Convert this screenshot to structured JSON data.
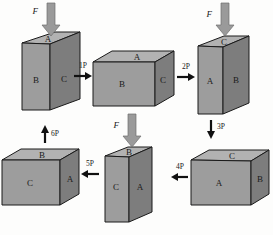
{
  "figure": {
    "caption": "",
    "colors": {
      "front_face": "#9d9d9d",
      "top_face": "#b2b2b2",
      "side_face": "#7d7d7d",
      "outline": "#1a1a1a",
      "force_arrow": "#9a9a9a",
      "step_arrow": "#111111",
      "background": "#fdfdfc"
    }
  },
  "boxes": [
    {
      "id": "box-1",
      "shape": "tall",
      "top_label": "A",
      "front_label": "B",
      "side_label": "C",
      "has_force": true,
      "force_label": "F"
    },
    {
      "id": "box-2",
      "shape": "wide",
      "top_label": "A",
      "front_label": "B",
      "side_label": "C",
      "has_force": false,
      "force_label": ""
    },
    {
      "id": "box-3",
      "shape": "tall",
      "top_label": "C",
      "front_label": "A",
      "side_label": "B",
      "has_force": true,
      "force_label": "F"
    },
    {
      "id": "box-4",
      "shape": "wide",
      "top_label": "C",
      "front_label": "A",
      "side_label": "B",
      "has_force": false,
      "force_label": ""
    },
    {
      "id": "box-5",
      "shape": "tall",
      "top_label": "B",
      "front_label": "C",
      "side_label": "A",
      "has_force": true,
      "force_label": "F"
    },
    {
      "id": "box-6",
      "shape": "wide",
      "top_label": "B",
      "front_label": "C",
      "side_label": "A",
      "has_force": false,
      "force_label": ""
    }
  ],
  "steps": [
    {
      "id": "step-1",
      "label": "1P",
      "direction": "right"
    },
    {
      "id": "step-2",
      "label": "2P",
      "direction": "right"
    },
    {
      "id": "step-3",
      "label": "3P",
      "direction": "down"
    },
    {
      "id": "step-4",
      "label": "4P",
      "direction": "left"
    },
    {
      "id": "step-5",
      "label": "5P",
      "direction": "left"
    },
    {
      "id": "step-6",
      "label": "6P",
      "direction": "up"
    }
  ]
}
